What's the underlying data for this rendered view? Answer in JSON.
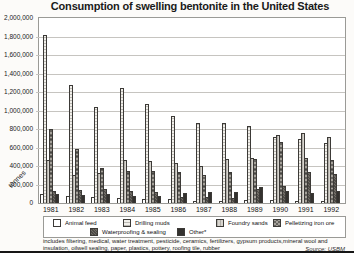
{
  "title": "Consumption of swelling bentonite  in the United States",
  "y_axis": {
    "labels": [
      "2,000,000",
      "1,800,000",
      "1,600,000",
      "1,400,000",
      "1,200,000",
      "1,000,000",
      "800,000",
      "600,000",
      "400,000",
      "200,000",
      "0"
    ],
    "unit_label": "tonnes"
  },
  "chart_data": {
    "type": "bar",
    "title": "Consumption of swelling bentonite in the United States",
    "xlabel": "",
    "ylabel": "tonnes",
    "ylim": [
      0,
      2000000
    ],
    "ytick_step": 200000,
    "grid": true,
    "legend_position": "bottom",
    "categories": [
      "1981",
      "1982",
      "1983",
      "1984",
      "1985",
      "1986",
      "1987",
      "1988",
      "1989",
      "1990",
      "1991",
      "1992"
    ],
    "series": [
      {
        "name": "Animal feed",
        "color": "#ffffff",
        "values": [
          100000,
          80000,
          65000,
          50000,
          45000,
          45000,
          25000,
          25000,
          30000,
          30000,
          25000,
          25000
        ]
      },
      {
        "name": "Drilling muds",
        "color": "#f1efea",
        "values": [
          1820000,
          1280000,
          1040000,
          1240000,
          1070000,
          940000,
          860000,
          860000,
          830000,
          715000,
          690000,
          650000
        ]
      },
      {
        "name": "Foundry sands",
        "color": "#d8d5cf",
        "values": [
          465000,
          300000,
          325000,
          465000,
          455000,
          435000,
          400000,
          480000,
          490000,
          740000,
          755000,
          710000
        ]
      },
      {
        "name": "Pelletizing iron ore",
        "color": "#a5a19a",
        "values": [
          805000,
          580000,
          380000,
          350000,
          345000,
          340000,
          300000,
          340000,
          480000,
          660000,
          490000,
          460000
        ]
      },
      {
        "name": "Waterproofing & sealing",
        "color": "#6f6b65",
        "values": [
          130000,
          145000,
          155000,
          130000,
          120000,
          60000,
          60000,
          50000,
          150000,
          185000,
          340000,
          315000
        ]
      },
      {
        "name": "Other*",
        "color": "#33312e",
        "values": [
          100000,
          85000,
          95000,
          80000,
          75000,
          110000,
          115000,
          120000,
          170000,
          135000,
          110000,
          130000
        ]
      }
    ]
  },
  "footnote": "includes filtering, medical, water treatment, pesticide, ceramics, fertilizers, gypsum products,mineral wool and insulation, oilwell sealing, paper, plastics, pottery, roofing tile, rubber",
  "source": "Source: USBM"
}
